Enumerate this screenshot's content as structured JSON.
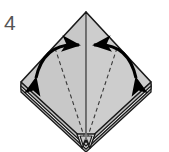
{
  "diagram": {
    "kind": "origami-folding-step",
    "step_number": "4",
    "background_color": "#ffffff",
    "title_color": "#555555",
    "model_shape": "diamond",
    "paper": {
      "fill_left": "#c8c8c8",
      "fill_right": "#cdcdcd",
      "fill_underlayer": "#b9b9b9",
      "fill_white_edge": "#ffffff",
      "outline_color": "#1a1a1a",
      "outline_width": 1.6
    },
    "vertices": {
      "top": [
        86,
        12
      ],
      "left": [
        21,
        82
      ],
      "right": [
        151,
        82
      ],
      "bottom": [
        86,
        142
      ]
    },
    "lines": {
      "center_line": {
        "name": "vertical-center-line",
        "style": "solid",
        "color": "#808080",
        "from": [
          86,
          14
        ],
        "to": [
          86,
          140
        ]
      },
      "creases": [
        {
          "name": "left-valley-crease",
          "style": "dashed",
          "color": "#3a3a3a",
          "from": [
            55,
            48
          ],
          "to": [
            84,
            136
          ]
        },
        {
          "name": "right-valley-crease",
          "style": "dashed",
          "color": "#3a3a3a",
          "from": [
            117,
            48
          ],
          "to": [
            88,
            136
          ]
        }
      ]
    },
    "arrows": [
      {
        "name": "left-fold-arrow",
        "type": "double-headed-arc",
        "color": "#000000",
        "meaning": "fold left flap up to center",
        "tail_point": [
          33,
          81
        ],
        "head_point": [
          80,
          44
        ]
      },
      {
        "name": "right-fold-arrow",
        "type": "double-headed-arc",
        "color": "#000000",
        "meaning": "fold right flap up to center",
        "tail_point": [
          139,
          81
        ],
        "head_point": [
          93,
          44
        ]
      }
    ],
    "layers": {
      "name": "stacked-paper-edges",
      "count": 3,
      "location": "bottom-left and bottom-right edges"
    },
    "bottom_notch": {
      "name": "bottom-layer-notch",
      "shape": "w-notch",
      "location": [
        86,
        142
      ]
    }
  }
}
